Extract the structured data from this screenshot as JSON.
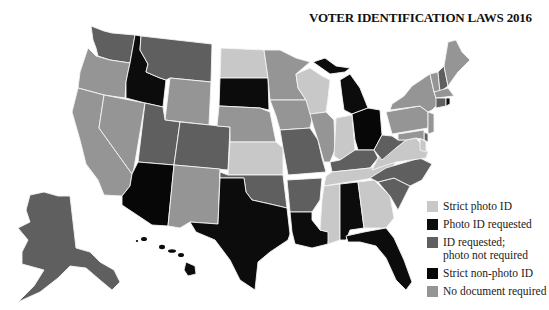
{
  "title": "VOTER IDENTIFICATION LAWS 2016",
  "legend": [
    {
      "key": "strict_photo",
      "label": "Strict photo ID",
      "color": "#c8c8c8"
    },
    {
      "key": "photo_requested",
      "label": "Photo ID requested",
      "color": "#0c0c0c"
    },
    {
      "key": "id_requested",
      "label": "ID requested;",
      "label2": "photo not required",
      "color": "#5f5f5f"
    },
    {
      "key": "strict_nonphoto",
      "label": "Strict non-photo ID",
      "color": "#070707"
    },
    {
      "key": "no_document",
      "label": "No document required",
      "color": "#959595"
    }
  ],
  "states": {
    "WA": "id_requested",
    "OR": "no_document",
    "CA": "no_document",
    "NV": "no_document",
    "ID": "photo_requested",
    "MT": "id_requested",
    "WY": "no_document",
    "UT": "id_requested",
    "CO": "id_requested",
    "AZ": "strict_nonphoto",
    "NM": "no_document",
    "ND": "strict_photo",
    "SD": "photo_requested",
    "NE": "no_document",
    "KS": "strict_photo",
    "OK": "id_requested",
    "TX": "strict_photo_black",
    "MN": "no_document",
    "IA": "no_document",
    "MO": "id_requested",
    "AR": "id_requested",
    "LA": "photo_requested",
    "WI": "strict_photo",
    "IL": "no_document",
    "MI": "photo_requested",
    "IN": "strict_photo",
    "OH": "strict_nonphoto",
    "KY": "id_requested",
    "TN": "strict_photo",
    "MS": "strict_photo",
    "AL": "photo_requested",
    "GA": "strict_photo",
    "FL": "photo_requested",
    "SC": "id_requested",
    "NC": "id_requested",
    "VA": "strict_photo",
    "WV": "id_requested",
    "PA": "no_document",
    "NY": "no_document",
    "VT": "no_document",
    "NH": "id_requested",
    "ME": "no_document",
    "MA": "no_document",
    "CT": "id_requested",
    "RI": "photo_requested",
    "NJ": "no_document",
    "DE": "id_requested",
    "MD": "no_document",
    "AK": "id_requested",
    "HI": "photo_requested"
  }
}
